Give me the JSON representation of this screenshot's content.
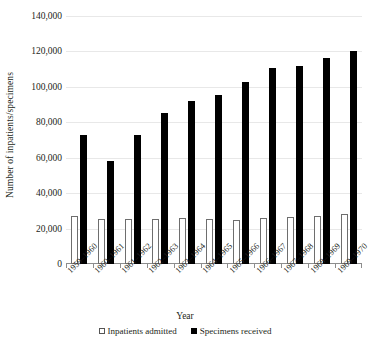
{
  "chart_data": {
    "type": "bar",
    "title": "",
    "xlabel": "Year",
    "ylabel": "Number of inpatients/specimens",
    "ylim": [
      0,
      140000
    ],
    "ytick_labels": [
      "140,000",
      "120,000",
      "100,000",
      "80,000",
      "60,000",
      "40,000",
      "20,000",
      "0"
    ],
    "ytick_values": [
      140000,
      120000,
      100000,
      80000,
      60000,
      40000,
      20000,
      0
    ],
    "grid": true,
    "legend_position": "bottom",
    "categories": [
      "1959–1960",
      "1960–1961",
      "1961–1962",
      "1962–1963",
      "1963–1964",
      "1964–1965",
      "1965–1966",
      "1966–1967",
      "1967–1968",
      "1968–1969",
      "1969–1970"
    ],
    "series": [
      {
        "name": "Inpatients admitted",
        "color": "#ffffff",
        "values": [
          27000,
          25500,
          25500,
          25500,
          26000,
          25500,
          25000,
          26000,
          26500,
          27000,
          28000
        ]
      },
      {
        "name": "Specimens received",
        "color": "#000000",
        "values": [
          73000,
          58000,
          73000,
          85000,
          92000,
          95500,
          103000,
          110500,
          112000,
          116500,
          120000
        ]
      }
    ]
  },
  "legend": {
    "items": [
      {
        "label": "Inpatients admitted",
        "swatch": "hollow"
      },
      {
        "label": "Specimens received",
        "swatch": "solid"
      }
    ]
  }
}
